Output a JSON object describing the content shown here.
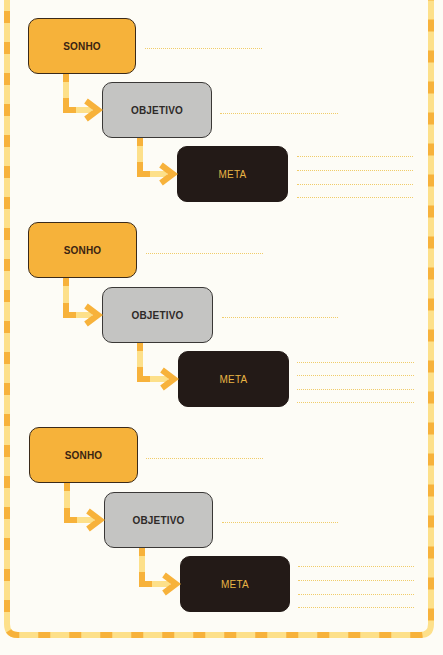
{
  "colors": {
    "sonho_fill": "#f6b23a",
    "objetivo_fill": "#c4c4c2",
    "meta_fill": "#231a17",
    "meta_text": "#e8b545",
    "border_dash_dark": "#f7b23b",
    "border_dash_light": "#fde08a",
    "writing_line": "#f0cc6a"
  },
  "groups": [
    {
      "sonho": {
        "label": "SONHO",
        "x": 28,
        "y": 18,
        "w": 108,
        "h": 56,
        "line": {
          "x": 145,
          "y": 48,
          "w": 117
        }
      },
      "objetivo": {
        "label": "OBJETIVO",
        "x": 102,
        "y": 82,
        "w": 110,
        "h": 56,
        "line": {
          "x": 220,
          "y": 113,
          "w": 118
        }
      },
      "meta": {
        "label": "META",
        "x": 177,
        "y": 146,
        "w": 111,
        "h": 56,
        "lines": [
          156,
          170,
          184,
          197
        ],
        "lines_x": 297,
        "lines_w": 116
      }
    },
    {
      "sonho": {
        "label": "SONHO",
        "x": 28,
        "y": 222,
        "w": 109,
        "h": 56,
        "line": {
          "x": 146,
          "y": 253,
          "w": 117
        }
      },
      "objetivo": {
        "label": "OBJETIVO",
        "x": 102,
        "y": 287,
        "w": 111,
        "h": 56,
        "line": {
          "x": 222,
          "y": 317,
          "w": 116
        }
      },
      "meta": {
        "label": "META",
        "x": 178,
        "y": 351,
        "w": 111,
        "h": 56,
        "lines": [
          362,
          375,
          389,
          402
        ],
        "lines_x": 297,
        "lines_w": 117
      }
    },
    {
      "sonho": {
        "label": "SONHO",
        "x": 29,
        "y": 427,
        "w": 109,
        "h": 56,
        "line": {
          "x": 146,
          "y": 458,
          "w": 117
        }
      },
      "objetivo": {
        "label": "OBJETIVO",
        "x": 104,
        "y": 492,
        "w": 109,
        "h": 56,
        "line": {
          "x": 222,
          "y": 522,
          "w": 116
        }
      },
      "meta": {
        "label": "META",
        "x": 180,
        "y": 556,
        "w": 110,
        "h": 56,
        "lines": [
          566,
          580,
          594,
          607
        ],
        "lines_x": 298,
        "lines_w": 116
      }
    }
  ]
}
